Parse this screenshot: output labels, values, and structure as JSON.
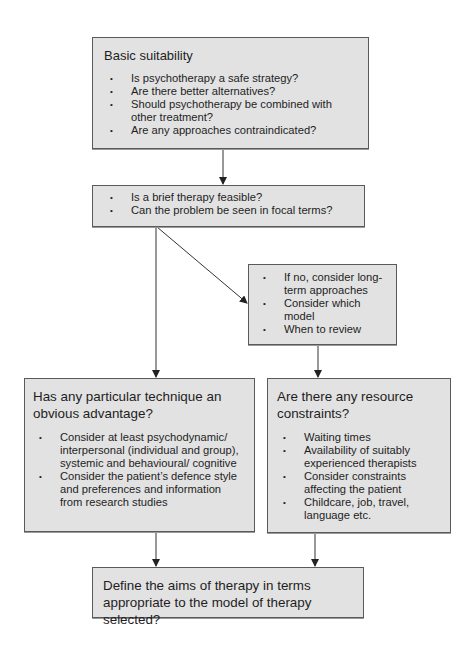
{
  "diagram": {
    "colors": {
      "box_fill": "#e2e2e2",
      "box_border": "#5a5a5a",
      "line": "#333333"
    },
    "boxes": [
      {
        "id": "basic-suitability",
        "title": "Basic suitability",
        "items": [
          "Is psychotherapy a safe strategy?",
          "Are there better alternatives?",
          "Should psychotherapy be combined with other treatment?",
          "Are any approaches contraindicated?"
        ]
      },
      {
        "id": "brief-therapy",
        "items": [
          "Is a brief therapy feasible?",
          "Can the problem be seen in focal terms?"
        ]
      },
      {
        "id": "long-term",
        "items": [
          "If no, consider long-term approaches",
          "Consider which model",
          "When to review"
        ]
      },
      {
        "id": "technique-advantage",
        "title": "Has any particular technique an obvious advantage?",
        "items": [
          "Consider at least psychodynamic/ interpersonal (individual and group), systemic and behavioural/ cognitive",
          "Consider the patient’s defence style and preferences and information from research studies"
        ]
      },
      {
        "id": "resource-constraints",
        "title": "Are there any resource constraints?",
        "items": [
          "Waiting times",
          "Availability of suitably experienced therapists",
          "Consider constraints affecting the patient",
          "Childcare, job, travel, language etc."
        ]
      },
      {
        "id": "define-aims",
        "title": "Define the aims of therapy in terms appropriate to the model of therapy selected?"
      }
    ],
    "edges": [
      {
        "from": "basic-suitability",
        "to": "brief-therapy"
      },
      {
        "from": "brief-therapy",
        "to": "long-term"
      },
      {
        "from": "brief-therapy",
        "to": "technique-advantage"
      },
      {
        "from": "long-term",
        "to": "resource-constraints"
      },
      {
        "from": "technique-advantage",
        "to": "define-aims"
      },
      {
        "from": "resource-constraints",
        "to": "define-aims"
      }
    ]
  }
}
